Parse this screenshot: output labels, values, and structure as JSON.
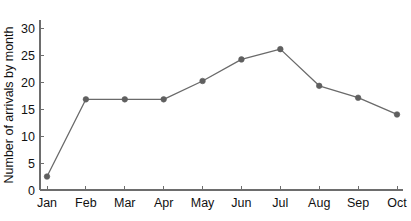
{
  "chart_data": {
    "type": "line",
    "title": "",
    "subtitle": "",
    "xlabel": "",
    "ylabel": "Number of arrivals by month",
    "categories": [
      "Jan",
      "Feb",
      "Mar",
      "Apr",
      "May",
      "Jun",
      "Jul",
      "Aug",
      "Sep",
      "Oct"
    ],
    "values": [
      2.5,
      16.8,
      16.8,
      16.8,
      20.2,
      24.2,
      26.1,
      19.3,
      17.1,
      14.0
    ],
    "series": [
      {
        "name": "Number of arrivals by month",
        "values": [
          2.5,
          16.8,
          16.8,
          16.8,
          20.2,
          24.2,
          26.1,
          19.3,
          17.1,
          14.0
        ]
      }
    ],
    "ylim": [
      0,
      31.5
    ],
    "yticks": [
      0,
      5,
      10,
      15,
      20,
      25,
      30
    ],
    "ytick_labels": [
      "0",
      "5",
      "10",
      "15",
      "20",
      "25",
      "30"
    ],
    "xtick_labels": [
      "Jan",
      "Feb",
      "Mar",
      "Apr",
      "May",
      "Jun",
      "Jul",
      "Aug",
      "Sep",
      "Oct"
    ],
    "grid": false,
    "legend": false,
    "legend_position": "none",
    "marker": "circle",
    "line_color": "#6a6a6a",
    "marker_color": "#5f5f5f",
    "axis_color": "#6d6d6d",
    "text_color": "#111111",
    "background_color": "#ffffff"
  }
}
